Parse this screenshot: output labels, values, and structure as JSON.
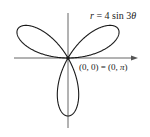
{
  "chart_data": {
    "type": "line",
    "subtype": "polar-rose",
    "title": "",
    "equation": {
      "text": "r = 4 sin 3θ",
      "parts": {
        "var": "r",
        "eq": " = 4 sin 3",
        "theta": "θ"
      },
      "a": 4,
      "k": 3,
      "function": "sin"
    },
    "annotations": [
      {
        "text": "(0, 0) = (0, π)",
        "parts": {
          "left": "(0, 0) = (0, ",
          "pi": "π",
          "right": ")"
        },
        "point": [
          0,
          0
        ]
      }
    ],
    "axes": {
      "x_axis": true,
      "y_axis": true,
      "x_arrow": true,
      "ticks": false,
      "grid": false
    },
    "petals": 3,
    "petal_directions_deg": [
      30,
      150,
      270
    ],
    "max_r": 4,
    "xlim": [
      -4.5,
      4.5
    ],
    "ylim": [
      -4.8,
      3.1
    ],
    "xlabel": "",
    "ylabel": "",
    "colors": {
      "curve": "#1a1a1a",
      "axes": "#555555",
      "text": "#222222"
    }
  }
}
